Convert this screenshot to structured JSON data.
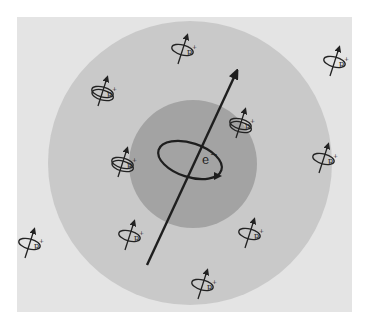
{
  "figure": {
    "colors": {
      "page": "#ffffff",
      "panel": "#e4e4e4",
      "outer_region": "#c9c9c9",
      "inner_region": "#a3a3a3",
      "ink": "#222222"
    },
    "electron": {
      "label": "e",
      "charge": "−",
      "center": [
        193,
        164
      ],
      "spin_axis": {
        "from": [
          147,
          265
        ],
        "to": [
          236,
          73
        ]
      }
    },
    "regions": {
      "outer": {
        "cx": 190,
        "cy": 163,
        "r": 142
      },
      "inner": {
        "cx": 193,
        "cy": 164,
        "r": 64
      }
    },
    "protons": [
      {
        "label": "p",
        "charge": "+",
        "x": 183,
        "y": 48,
        "double_ring": false
      },
      {
        "label": "p",
        "charge": "+",
        "x": 335,
        "y": 60,
        "double_ring": false
      },
      {
        "label": "p",
        "charge": "+",
        "x": 103,
        "y": 90,
        "double_ring": true
      },
      {
        "label": "p",
        "charge": "+",
        "x": 241,
        "y": 122,
        "double_ring": true
      },
      {
        "label": "p",
        "charge": "+",
        "x": 123,
        "y": 161,
        "double_ring": true
      },
      {
        "label": "p",
        "charge": "+",
        "x": 324,
        "y": 157,
        "double_ring": false
      },
      {
        "label": "p",
        "charge": "+",
        "x": 30,
        "y": 242,
        "double_ring": false
      },
      {
        "label": "p",
        "charge": "+",
        "x": 130,
        "y": 234,
        "double_ring": false
      },
      {
        "label": "p",
        "charge": "+",
        "x": 250,
        "y": 232,
        "double_ring": false
      },
      {
        "label": "p",
        "charge": "+",
        "x": 203,
        "y": 283,
        "double_ring": false
      }
    ]
  }
}
